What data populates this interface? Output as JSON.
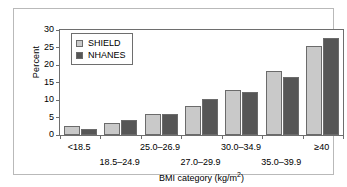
{
  "chart_data": {
    "type": "bar",
    "title": "",
    "xlabel": "BMI category (kg/m2)",
    "xlabel_base": "BMI category (kg/m",
    "xlabel_sup": "2",
    "xlabel_tail": ")",
    "ylabel": "Percent",
    "ylim": [
      0,
      30
    ],
    "yticks": [
      0,
      5,
      10,
      15,
      20,
      25,
      30
    ],
    "grid": false,
    "legend_position": "top-left",
    "categories": [
      "<18.5",
      "18.5–24.9",
      "25.0–26.9",
      "27.0–29.9",
      "30.0–34.9",
      "35.0–39.9",
      "≥40"
    ],
    "series": [
      {
        "name": "SHIELD",
        "color": "#c9c9c9",
        "values": [
          2.6,
          3.5,
          6.1,
          8.2,
          13.0,
          18.2,
          25.4
        ]
      },
      {
        "name": "NHANES",
        "color": "#565656",
        "values": [
          1.7,
          4.2,
          5.9,
          10.3,
          12.3,
          16.6,
          27.6
        ]
      }
    ]
  }
}
